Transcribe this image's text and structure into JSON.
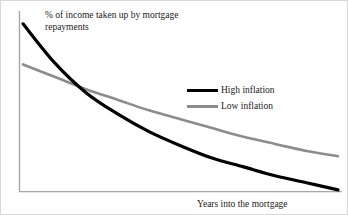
{
  "figure": {
    "background_color": "#ffffff",
    "axis_color": "#a6a6a6",
    "border_color": "#d8d8d8"
  },
  "axes": {
    "y_axis_label": "% of income taken up by mortgage repayments",
    "x_axis_label": "Years into the mortgage"
  },
  "legend": {
    "items": [
      {
        "label": "High inflation",
        "color": "#000000",
        "width": 3
      },
      {
        "label": "Low inflation",
        "color": "#8c8c8c",
        "width": 3
      }
    ]
  },
  "chart_data": {
    "type": "line",
    "title": "",
    "subtitle": "",
    "xlabel": "Years into the mortgage",
    "ylabel": "% of income taken up by mortgage repayments",
    "xlim": [
      0,
      25
    ],
    "ylim": [
      0,
      100
    ],
    "grid": false,
    "x_ticks": [],
    "y_ticks": [],
    "legend_position": "center-right",
    "annotations": [
      "Curves cross at roughly 6 years into the mortgage",
      "High inflation starts highest and falls steeply to near zero",
      "Low inflation starts lower and declines gradually"
    ],
    "x": [
      0,
      2.5,
      5,
      7.5,
      10,
      12.5,
      15,
      17.5,
      20,
      22.5,
      25
    ],
    "series": [
      {
        "name": "High inflation",
        "color": "#000000",
        "values": [
          95,
          73,
          56,
          44,
          34,
          26,
          19,
          14,
          9,
          5,
          1
        ]
      },
      {
        "name": "Low inflation",
        "color": "#8c8c8c",
        "values": [
          72,
          65,
          58,
          52,
          46,
          41,
          36,
          31,
          27,
          23,
          20
        ]
      }
    ]
  }
}
